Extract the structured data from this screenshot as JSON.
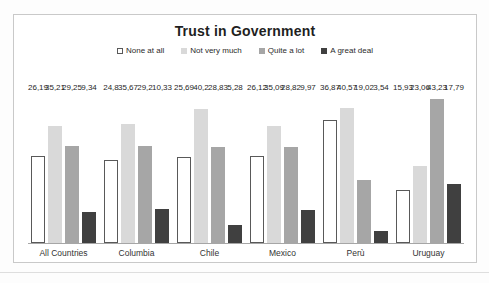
{
  "chart_data": {
    "type": "bar",
    "title": "Trust in Government",
    "categories": [
      "All Countries",
      "Columbia",
      "Chile",
      "Mexico",
      "Perù",
      "Uruguay"
    ],
    "series": [
      {
        "name": "None at all",
        "values": [
          26.19,
          24.8,
          25.69,
          26.12,
          36.87,
          15.93
        ],
        "labels": [
          "26,19",
          "24,8",
          "25,69",
          "26,12",
          "36,87",
          "15,93"
        ],
        "fill": "#ffffff",
        "border": "#595959"
      },
      {
        "name": "Not very much",
        "values": [
          35.21,
          35.67,
          40.2,
          35.09,
          40.57,
          23.06
        ],
        "labels": [
          "35,21",
          "35,67",
          "40,2",
          "35,09",
          "40,57",
          "23,06"
        ],
        "fill": "#d9d9d9",
        "border": ""
      },
      {
        "name": "Quite a lot",
        "values": [
          29.25,
          29.2,
          28.83,
          28.82,
          19.02,
          43.23
        ],
        "labels": [
          "29,25",
          "29,2",
          "28,83",
          "28,82",
          "19,02",
          "43,23"
        ],
        "fill": "#a6a6a6",
        "border": ""
      },
      {
        "name": "A great deal",
        "values": [
          9.34,
          10.33,
          5.28,
          9.97,
          3.54,
          17.79
        ],
        "labels": [
          "9,34",
          "10,33",
          "5,28",
          "9,97",
          "3,54",
          "17,79"
        ],
        "fill": "#404040",
        "border": ""
      }
    ],
    "ylim": [
      0,
      45
    ],
    "xlabel": "",
    "ylabel": "",
    "grid": false,
    "legend_position": "top",
    "axis_line_color": "#a6a6a6",
    "data_labels": true
  }
}
